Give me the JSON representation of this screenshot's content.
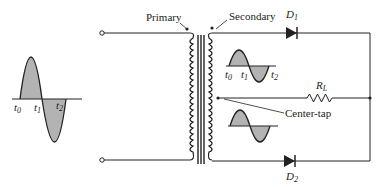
{
  "diagram": {
    "labels": {
      "primary": "Primary",
      "secondary": "Secondary",
      "center_tap": "Center-tap",
      "d1": "D",
      "d1_sub": "1",
      "d2": "D",
      "d2_sub": "2",
      "rl": "R",
      "rl_sub": "L"
    },
    "input_wave": {
      "t0": "t",
      "t0_sub": "0",
      "t1": "t",
      "t1_sub": "1",
      "t2": "t",
      "t2_sub": "2"
    },
    "secondary_wave_upper": {
      "t0": "t",
      "t0_sub": "0",
      "t1": "t",
      "t1_sub": "1",
      "t2": "t",
      "t2_sub": "2"
    },
    "colors": {
      "line": "#222222",
      "fill": "#b3b3b3"
    }
  }
}
